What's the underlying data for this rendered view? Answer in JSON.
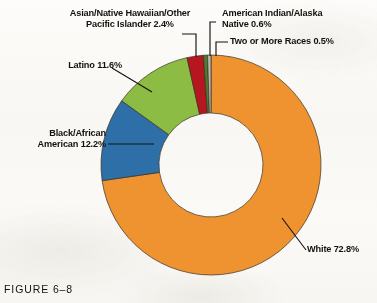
{
  "figure": {
    "caption": "FIGURE 6–8"
  },
  "chart_data": {
    "type": "pie",
    "variant": "donut",
    "title": "",
    "xlabel": "",
    "ylabel": "",
    "legend_position": "callout-labels",
    "grid": false,
    "units": "percent",
    "total": 100.1,
    "start_angle_deg": 0,
    "direction": "clockwise",
    "geometry": {
      "center_x": 211,
      "center_y": 165,
      "outer_radius": 110,
      "inner_radius": 52
    },
    "categories": [
      "White",
      "Black/African American",
      "Latino",
      "Asian/Native Hawaiian/Other Pacific Islander",
      "American Indian/Alaska Native",
      "Two or More Races"
    ],
    "values": [
      72.8,
      12.2,
      11.6,
      2.4,
      0.6,
      0.5
    ],
    "colors": [
      "#ee9330",
      "#2f6fa8",
      "#8cbc44",
      "#b5161f",
      "#4f7a33",
      "#b9bcae"
    ],
    "slices": [
      {
        "label": "White",
        "value": 72.8,
        "display": "White 72.8%",
        "color": "#ee9330"
      },
      {
        "label": "Black/African American",
        "value": 12.2,
        "display": "Black/African American 12.2%",
        "color": "#2f6fa8"
      },
      {
        "label": "Latino",
        "value": 11.6,
        "display": "Latino 11.6%",
        "color": "#8cbc44"
      },
      {
        "label": "Asian/Native Hawaiian/Other Pacific Islander",
        "value": 2.4,
        "display": "Asian/Native Hawaiian/Other Pacific Islander 2.4%",
        "color": "#b5161f"
      },
      {
        "label": "American Indian/Alaska Native",
        "value": 0.6,
        "display": "American Indian/Alaska Native 0.6%",
        "color": "#4f7a33"
      },
      {
        "label": "Two or More Races",
        "value": 0.5,
        "display": "Two or More Races 0.5%",
        "color": "#b9bcae"
      }
    ]
  },
  "callouts": {
    "asian": "Asian/Native Hawaiian/Other\nPacific Islander 2.4%",
    "american_indian": "American Indian/Alaska\nNative 0.6%",
    "two_or_more": "Two or More Races 0.5%",
    "latino": "Latino 11.6%",
    "black": "Black/African\nAmerican 12.2%",
    "white": "White 72.8%"
  }
}
